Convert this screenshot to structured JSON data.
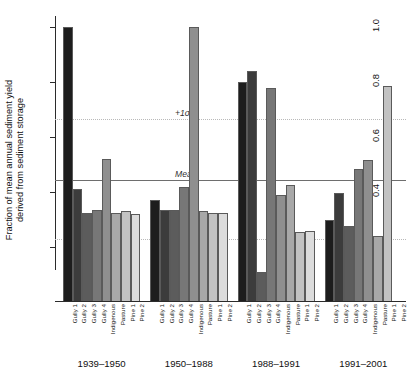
{
  "chart_data": {
    "type": "bar",
    "title": "",
    "subtitle": "",
    "xlabel": "",
    "ylabel": "Fraction of mean annual sediment yield derived from sediment storage",
    "ylabel_line1": "Fraction of mean annual sediment yield",
    "ylabel_line2": "derived from sediment storage",
    "ylim": [
      0,
      1.04
    ],
    "ytick_values": [
      0.2,
      0.4,
      0.6,
      0.8,
      1.0
    ],
    "ytick_labels": [
      "0.2",
      "0.4",
      "0.6",
      "0.8",
      "1.0"
    ],
    "grid": false,
    "legend": "none",
    "categories": [
      "Gully 1",
      "Gully 2",
      "Gully 3",
      "Gully 4",
      "Indigenous",
      "Pasture",
      "Pine 1",
      "Pine 2"
    ],
    "category_colors": [
      "#1d1d1d",
      "#3c3c3c",
      "#5c5c5c",
      "#777777",
      "#8f8f8f",
      "#a8a8a8",
      "#c2c2c2",
      "#dcdcdc"
    ],
    "groups": [
      {
        "name": "1939–1950",
        "values": [
          1.0,
          0.41,
          0.325,
          0.335,
          0.52,
          0.325,
          0.33,
          0.32
        ]
      },
      {
        "name": "1950–1988",
        "values": [
          0.37,
          0.335,
          0.335,
          0.42,
          1.0,
          0.33,
          0.325,
          0.325
        ]
      },
      {
        "name": "1988–1991",
        "values": [
          0.8,
          0.84,
          0.11,
          0.78,
          0.39,
          0.425,
          0.255,
          0.26
        ]
      },
      {
        "name": "1991–2001",
        "values": [
          0.3,
          0.395,
          0.275,
          0.485,
          0.515,
          0.24,
          0.785,
          0.0
        ]
      }
    ],
    "reference_lines": [
      {
        "id": "plus-1-sigma",
        "label": "+1σ",
        "value": 0.665,
        "style": "dotted",
        "color": "#b9b9b9"
      },
      {
        "id": "mean",
        "label": "Mean",
        "value": 0.445,
        "style": "solid",
        "color": "#6e6e6e"
      },
      {
        "id": "minus-1-sigma",
        "label": "−1σ",
        "value": 0.228,
        "style": "dotted",
        "color": "#b9b9b9"
      }
    ]
  }
}
